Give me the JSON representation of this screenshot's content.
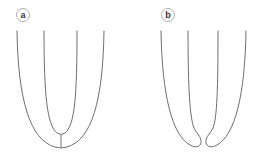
{
  "figure": {
    "panels": [
      {
        "label": "a",
        "description": "Two nested U-shaped curves joined at the bottom by a short vertical stem"
      },
      {
        "label": "b",
        "description": "Two J-shaped curves curling inward at the bottom, not connected"
      }
    ],
    "colors": {
      "line": "#6e6e6e",
      "badge_border": "#9a9a9a",
      "badge_text": "#333333",
      "background": "#ffffff"
    }
  }
}
